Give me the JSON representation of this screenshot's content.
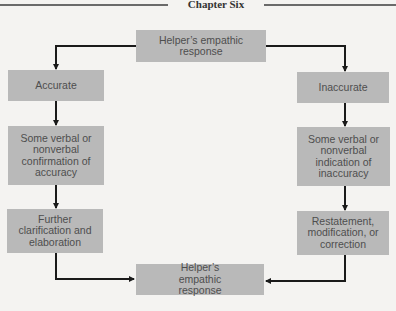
{
  "header": {
    "title": "Chapter Six"
  },
  "diagram": {
    "top": {
      "label": "Helper’s empathic response"
    },
    "left": [
      {
        "label": "Accurate"
      },
      {
        "label": "Some verbal or nonverbal confirmation of accuracy"
      },
      {
        "label": "Further clarification and elaboration"
      }
    ],
    "right": [
      {
        "label": "Inaccurate"
      },
      {
        "label": "Some verbal or nonverbal indication of inaccuracy"
      },
      {
        "label": "Restatement, modification, or correction"
      }
    ],
    "bottom": {
      "label": "Helper’s empathic response"
    }
  },
  "colors": {
    "box": "#b9b9b9",
    "text": "#4e4e4e",
    "line": "#1a1a1a",
    "background": "#f4f3f1"
  }
}
